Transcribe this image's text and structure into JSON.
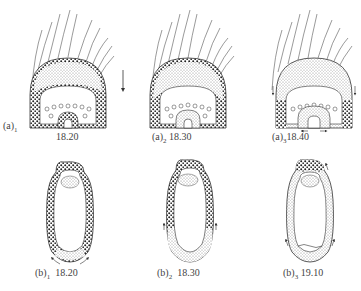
{
  "figure": {
    "panels": [
      {
        "id": "a1",
        "letter": "(a)",
        "sub": "1",
        "time": "18.20"
      },
      {
        "id": "a2",
        "letter": "(a)",
        "sub": "2",
        "time": "18.30"
      },
      {
        "id": "a3",
        "letter": "(a)",
        "sub": "3",
        "time": "18.40"
      },
      {
        "id": "b1",
        "letter": "(b)",
        "sub": "1",
        "time": "18.20"
      },
      {
        "id": "b2",
        "letter": "(b)",
        "sub": "2",
        "time": "18.30"
      },
      {
        "id": "b3",
        "letter": "(b)",
        "sub": "3",
        "time": "19.10"
      }
    ],
    "colors": {
      "ink": "#333333",
      "stipple": "#777777",
      "background": "#ffffff"
    }
  }
}
